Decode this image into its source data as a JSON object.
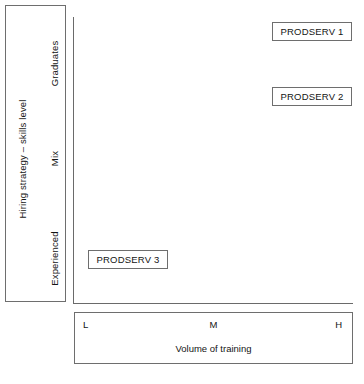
{
  "figure": {
    "type": "positioning-matrix",
    "background_color": "#ffffff",
    "line_color": "#6e6e6e",
    "text_color": "#141414"
  },
  "y_axis": {
    "title": "Hiring strategy – skills level",
    "categories": [
      {
        "label": "Graduates"
      },
      {
        "label": "Mix"
      },
      {
        "label": "Experienced"
      }
    ]
  },
  "x_axis": {
    "title": "Volume of training",
    "ticks": [
      {
        "label": "L"
      },
      {
        "label": "M"
      },
      {
        "label": "H"
      }
    ]
  },
  "items": [
    {
      "label": "PRODSERV 1",
      "x_level": "H",
      "y_level": "Graduates"
    },
    {
      "label": "PRODSERV 2",
      "x_level": "H",
      "y_level": "Graduates"
    },
    {
      "label": "PRODSERV 3",
      "x_level": "L",
      "y_level": "Experienced"
    }
  ],
  "chart_data": {
    "type": "scatter",
    "title": "",
    "xlabel": "Volume of training",
    "ylabel": "Hiring strategy – skills level",
    "x_tick_labels": [
      "L",
      "M",
      "H"
    ],
    "y_tick_labels": [
      "Experienced",
      "Mix",
      "Graduates"
    ],
    "grid": false,
    "legend": "none",
    "points": [
      {
        "name": "PRODSERV 1",
        "x": "H",
        "y": "Graduates"
      },
      {
        "name": "PRODSERV 2",
        "x": "H",
        "y": "Graduates"
      },
      {
        "name": "PRODSERV 3",
        "x": "L",
        "y": "Experienced"
      }
    ]
  }
}
